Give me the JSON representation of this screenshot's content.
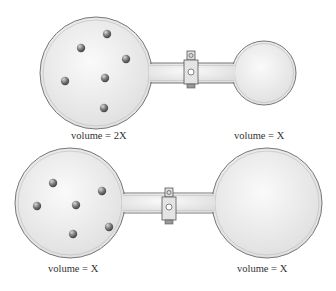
{
  "diagrams": [
    {
      "name": "top-apparatus",
      "left_flask": {
        "label": "volume = 2X",
        "molecule_count": 6
      },
      "right_flask": {
        "label": "volume = X",
        "molecule_count": 0
      },
      "valve": "closed"
    },
    {
      "name": "bottom-apparatus",
      "left_flask": {
        "label": "volume = X",
        "molecule_count": 6
      },
      "right_flask": {
        "label": "volume = X",
        "molecule_count": 0
      },
      "valve": "closed"
    }
  ],
  "colors": {
    "glass_fill": "#e9e9e9",
    "glass_outline": "#777777",
    "molecule": "#6a6a6a",
    "text": "#333333"
  }
}
